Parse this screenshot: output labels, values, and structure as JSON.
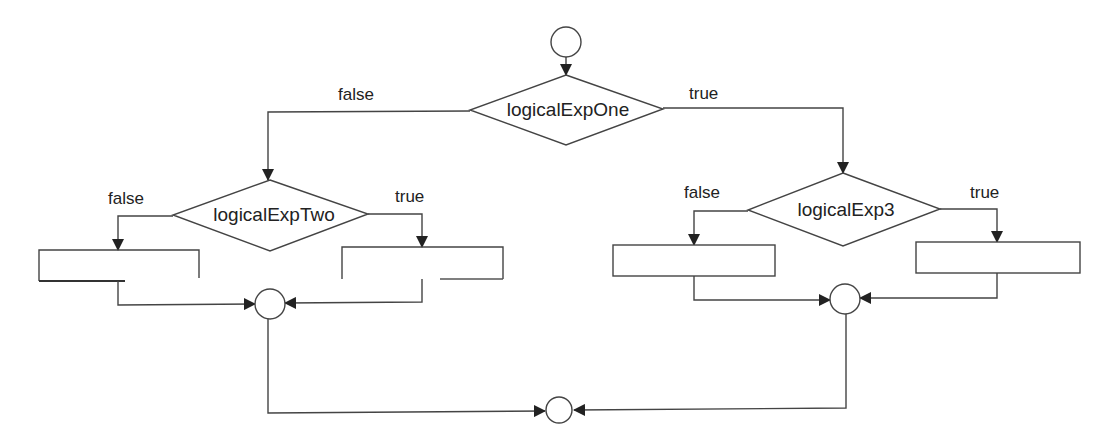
{
  "diagram": {
    "type": "flowchart",
    "title": "",
    "stroke_color": "#333333",
    "background": "#ffffff",
    "nodes": {
      "start": {
        "shape": "circle"
      },
      "decision_one": {
        "shape": "diamond",
        "label": "logicalExpOne"
      },
      "decision_two": {
        "shape": "diamond",
        "label": "logicalExpTwo"
      },
      "decision_three": {
        "shape": "diamond",
        "label": "logicalExp3"
      },
      "box_two_false": {
        "shape": "rectangle",
        "label": ""
      },
      "box_two_true": {
        "shape": "rectangle",
        "label": ""
      },
      "box_three_false": {
        "shape": "rectangle",
        "label": ""
      },
      "box_three_true": {
        "shape": "rectangle",
        "label": ""
      },
      "merge_left": {
        "shape": "circle"
      },
      "merge_right": {
        "shape": "circle"
      },
      "end": {
        "shape": "circle"
      }
    },
    "edge_labels": {
      "one_false": "false",
      "one_true": "true",
      "two_false": "false",
      "two_true": "true",
      "three_false": "false",
      "three_true": "true"
    },
    "edges": [
      {
        "from": "start",
        "to": "decision_one"
      },
      {
        "from": "decision_one",
        "to": "decision_two",
        "label": "false"
      },
      {
        "from": "decision_one",
        "to": "decision_three",
        "label": "true"
      },
      {
        "from": "decision_two",
        "to": "box_two_false",
        "label": "false"
      },
      {
        "from": "decision_two",
        "to": "box_two_true",
        "label": "true"
      },
      {
        "from": "decision_three",
        "to": "box_three_false",
        "label": "false"
      },
      {
        "from": "decision_three",
        "to": "box_three_true",
        "label": "true"
      },
      {
        "from": "box_two_false",
        "to": "merge_left"
      },
      {
        "from": "box_two_true",
        "to": "merge_left"
      },
      {
        "from": "box_three_false",
        "to": "merge_right"
      },
      {
        "from": "box_three_true",
        "to": "merge_right"
      },
      {
        "from": "merge_left",
        "to": "end"
      },
      {
        "from": "merge_right",
        "to": "end"
      }
    ]
  }
}
